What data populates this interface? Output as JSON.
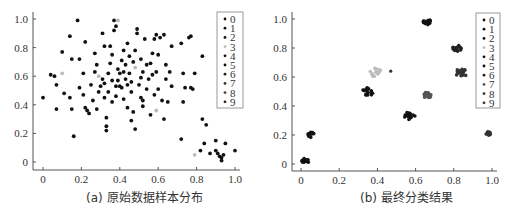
{
  "chart_data": [
    {
      "type": "scatter",
      "title": "",
      "caption": "(a) 原始数据样本分布",
      "xlabel": "",
      "ylabel": "",
      "xlim": [
        0,
        1.0
      ],
      "ylim": [
        0,
        1.0
      ],
      "x_ticks": [
        "0",
        "0.2",
        "0.4",
        "0.6",
        "0.8",
        "1.0"
      ],
      "y_ticks": [
        "0",
        "0.2",
        "0.4",
        "0.6",
        "0.8",
        "1.0"
      ],
      "grid": false,
      "legend_position": "upper right",
      "legend": [
        "0",
        "1",
        "2",
        "3",
        "4",
        "5",
        "6",
        "7",
        "8",
        "9"
      ],
      "series_colors": [
        "#111",
        "#111",
        "#111",
        "#bbb",
        "#111",
        "#111",
        "#222",
        "#333",
        "#444",
        "#222"
      ],
      "points": [
        [
          0.0,
          0.45
        ],
        [
          0.04,
          0.61
        ],
        [
          0.06,
          0.6
        ],
        [
          0.07,
          0.37
        ],
        [
          0.07,
          0.54
        ],
        [
          0.1,
          0.62
        ],
        [
          0.1,
          0.77
        ],
        [
          0.11,
          0.48
        ],
        [
          0.14,
          0.88
        ],
        [
          0.15,
          0.37
        ],
        [
          0.14,
          0.45
        ],
        [
          0.15,
          0.72
        ],
        [
          0.16,
          0.18
        ],
        [
          0.18,
          0.99
        ],
        [
          0.19,
          0.52
        ],
        [
          0.19,
          0.72
        ],
        [
          0.21,
          0.62
        ],
        [
          0.21,
          0.47
        ],
        [
          0.22,
          0.84
        ],
        [
          0.22,
          0.38
        ],
        [
          0.23,
          0.36
        ],
        [
          0.24,
          0.34
        ],
        [
          0.25,
          0.54
        ],
        [
          0.26,
          0.43
        ],
        [
          0.27,
          0.76
        ],
        [
          0.27,
          0.63
        ],
        [
          0.28,
          0.68
        ],
        [
          0.28,
          0.37
        ],
        [
          0.29,
          0.6
        ],
        [
          0.29,
          0.49
        ],
        [
          0.3,
          0.53
        ],
        [
          0.31,
          0.9
        ],
        [
          0.31,
          0.58
        ],
        [
          0.32,
          0.81
        ],
        [
          0.32,
          0.55
        ],
        [
          0.32,
          0.45
        ],
        [
          0.33,
          0.31
        ],
        [
          0.33,
          0.25
        ],
        [
          0.33,
          0.22
        ],
        [
          0.34,
          0.49
        ],
        [
          0.34,
          0.62
        ],
        [
          0.35,
          0.69
        ],
        [
          0.35,
          0.81
        ],
        [
          0.36,
          0.57
        ],
        [
          0.36,
          0.42
        ],
        [
          0.36,
          0.75
        ],
        [
          0.37,
          0.99
        ],
        [
          0.37,
          0.92
        ],
        [
          0.38,
          0.95
        ],
        [
          0.38,
          0.53
        ],
        [
          0.38,
          0.46
        ],
        [
          0.39,
          0.99
        ],
        [
          0.39,
          0.65
        ],
        [
          0.39,
          0.57
        ],
        [
          0.4,
          0.62
        ],
        [
          0.4,
          0.53
        ],
        [
          0.41,
          0.71
        ],
        [
          0.41,
          0.52
        ],
        [
          0.42,
          0.63
        ],
        [
          0.42,
          0.78
        ],
        [
          0.42,
          0.44
        ],
        [
          0.43,
          0.58
        ],
        [
          0.43,
          0.68
        ],
        [
          0.44,
          0.83
        ],
        [
          0.44,
          0.54
        ],
        [
          0.44,
          0.38
        ],
        [
          0.45,
          0.74
        ],
        [
          0.45,
          0.62
        ],
        [
          0.46,
          0.56
        ],
        [
          0.46,
          0.49
        ],
        [
          0.46,
          0.29
        ],
        [
          0.47,
          0.7
        ],
        [
          0.47,
          0.35
        ],
        [
          0.48,
          0.78
        ],
        [
          0.48,
          0.66
        ],
        [
          0.48,
          0.23
        ],
        [
          0.49,
          0.93
        ],
        [
          0.49,
          0.9
        ],
        [
          0.5,
          0.54
        ],
        [
          0.51,
          0.45
        ],
        [
          0.51,
          0.59
        ],
        [
          0.51,
          0.72
        ],
        [
          0.52,
          0.63
        ],
        [
          0.52,
          0.43
        ],
        [
          0.52,
          0.39
        ],
        [
          0.53,
          0.86
        ],
        [
          0.54,
          0.68
        ],
        [
          0.54,
          0.51
        ],
        [
          0.55,
          0.58
        ],
        [
          0.56,
          0.33
        ],
        [
          0.56,
          0.69
        ],
        [
          0.57,
          0.76
        ],
        [
          0.57,
          0.61
        ],
        [
          0.58,
          0.47
        ],
        [
          0.58,
          0.86
        ],
        [
          0.59,
          0.89
        ],
        [
          0.59,
          0.63
        ],
        [
          0.59,
          0.36
        ],
        [
          0.6,
          0.75
        ],
        [
          0.6,
          0.51
        ],
        [
          0.61,
          0.87
        ],
        [
          0.62,
          0.43
        ],
        [
          0.63,
          0.89
        ],
        [
          0.63,
          0.3
        ],
        [
          0.64,
          0.58
        ],
        [
          0.64,
          0.68
        ],
        [
          0.65,
          0.42
        ],
        [
          0.66,
          0.63
        ],
        [
          0.67,
          0.81
        ],
        [
          0.67,
          0.53
        ],
        [
          0.72,
          0.83
        ],
        [
          0.72,
          0.16
        ],
        [
          0.73,
          0.42
        ],
        [
          0.73,
          0.62
        ],
        [
          0.74,
          0.52
        ],
        [
          0.76,
          0.87
        ],
        [
          0.77,
          0.88
        ],
        [
          0.77,
          0.52
        ],
        [
          0.78,
          0.51
        ],
        [
          0.79,
          0.62
        ],
        [
          0.79,
          0.05
        ],
        [
          0.82,
          0.08
        ],
        [
          0.83,
          0.74
        ],
        [
          0.83,
          0.3
        ],
        [
          0.84,
          0.13
        ],
        [
          0.85,
          0.26
        ],
        [
          0.87,
          0.06
        ],
        [
          0.9,
          0.15
        ],
        [
          0.9,
          0.08
        ],
        [
          0.91,
          0.06
        ],
        [
          0.92,
          0.04
        ],
        [
          0.93,
          0.03
        ],
        [
          0.93,
          0.01
        ],
        [
          0.94,
          0.05
        ],
        [
          0.95,
          0.13
        ],
        [
          1.0,
          0.08
        ]
      ]
    },
    {
      "type": "scatter",
      "title": "",
      "caption": "(b) 最终分类结果",
      "xlabel": "",
      "ylabel": "",
      "xlim": [
        0,
        1.0
      ],
      "ylim": [
        0,
        1.0
      ],
      "x_ticks": [
        "0",
        "0.2",
        "0.4",
        "0.6",
        "0.8",
        "1.0"
      ],
      "y_ticks": [
        "0",
        "0.2",
        "0.4",
        "0.6",
        "0.8",
        "1.0"
      ],
      "grid": false,
      "legend_position": "upper right",
      "legend": [
        "0",
        "1",
        "2",
        "3",
        "4",
        "5",
        "6",
        "7",
        "8",
        "9"
      ],
      "series_colors": [
        "#111",
        "#111",
        "#111",
        "#bbb",
        "#111",
        "#111",
        "#222",
        "#555",
        "#333",
        "#333"
      ],
      "clusters": [
        {
          "label": "0",
          "center": [
            0.02,
            0.02
          ],
          "spread": 0.02,
          "n": 14
        },
        {
          "label": "1",
          "center": [
            0.05,
            0.2
          ],
          "spread": 0.02,
          "n": 14
        },
        {
          "label": "2",
          "center": [
            0.35,
            0.5
          ],
          "spread": 0.03,
          "n": 16
        },
        {
          "label": "3",
          "center": [
            0.39,
            0.63
          ],
          "spread": 0.03,
          "n": 14
        },
        {
          "label": "4",
          "center": [
            0.57,
            0.33
          ],
          "spread": 0.03,
          "n": 16
        },
        {
          "label": "5",
          "center": [
            0.66,
            0.98
          ],
          "spread": 0.02,
          "n": 14
        },
        {
          "label": "6",
          "center": [
            0.82,
            0.8
          ],
          "spread": 0.025,
          "n": 14
        },
        {
          "label": "7",
          "center": [
            0.66,
            0.47
          ],
          "spread": 0.025,
          "n": 14
        },
        {
          "label": "8",
          "center": [
            0.84,
            0.63
          ],
          "spread": 0.03,
          "n": 16
        },
        {
          "label": "9",
          "center": [
            0.98,
            0.21
          ],
          "spread": 0.015,
          "n": 10
        }
      ]
    }
  ]
}
